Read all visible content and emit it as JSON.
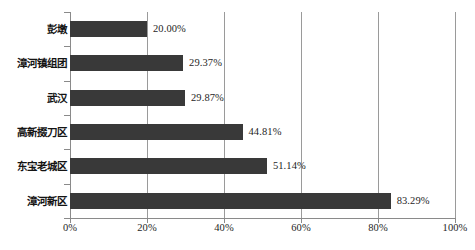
{
  "chart_data": {
    "type": "bar",
    "orientation": "horizontal",
    "title": "",
    "subtitle": "",
    "xlabel": "",
    "ylabel": "",
    "categories": [
      "彭墩",
      "漳河镇组团",
      "武汉",
      "高新掇刀区",
      "东宝老城区",
      "漳河新区"
    ],
    "values": [
      20.0,
      29.37,
      29.87,
      44.81,
      51.14,
      83.29
    ],
    "value_labels": [
      "20.00%",
      "29.37%",
      "29.87%",
      "44.81%",
      "51.14%",
      "83.29%"
    ],
    "xlim": [
      0,
      100
    ],
    "x_ticks": [
      0,
      20,
      40,
      60,
      80,
      100
    ],
    "x_tick_labels": [
      "0%",
      "20%",
      "40%",
      "60%",
      "80%",
      "100%"
    ],
    "grid": "vertical",
    "legend": "none",
    "bar_color": "#393939",
    "grid_color": "#9a9a9a",
    "axis_color": "#8a8a8a",
    "background": "#ffffff"
  }
}
